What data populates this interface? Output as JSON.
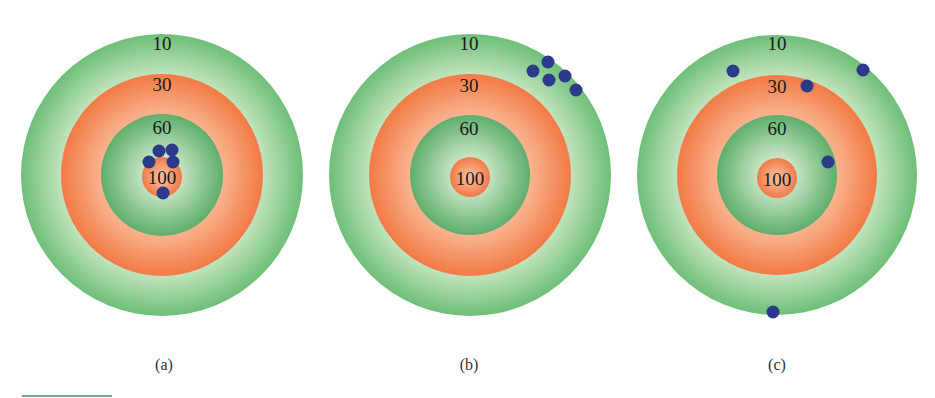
{
  "figure": {
    "colors": {
      "green_dark": "#5eae6c",
      "green_light": "#c6e5c0",
      "orange_dark": "#f27a45",
      "orange_light": "#f8ae88",
      "dot": "#2b3a8a",
      "rule": "#6fa896"
    },
    "ring_labels": [
      "10",
      "30",
      "60",
      "100"
    ],
    "targets": [
      {
        "id": "a",
        "caption": "(a)",
        "center": [
          162,
          175
        ],
        "dots": [
          [
            159,
            151
          ],
          [
            172,
            150
          ],
          [
            149,
            162
          ],
          [
            173,
            162
          ],
          [
            163,
            193
          ]
        ]
      },
      {
        "id": "b",
        "caption": "(b)",
        "center": [
          470,
          175
        ],
        "dots": [
          [
            533,
            71
          ],
          [
            548,
            62
          ],
          [
            549,
            80
          ],
          [
            565,
            76
          ],
          [
            576,
            90
          ]
        ]
      },
      {
        "id": "c",
        "caption": "(c)",
        "center": [
          777,
          175
        ],
        "dots": [
          [
            733,
            71
          ],
          [
            862,
            70
          ],
          [
            807,
            86
          ],
          [
            828,
            162
          ],
          [
            773,
            312
          ]
        ]
      }
    ]
  }
}
